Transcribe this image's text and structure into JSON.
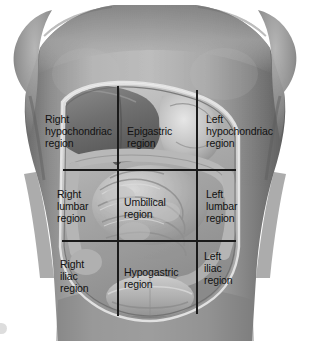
{
  "figure": {
    "style": "grayscale-anatomical-illustration",
    "background_color": "#ffffff",
    "line_color": "#1a1a1a",
    "label_color": "#111111"
  },
  "palette": {
    "skin_light": "#b9b9b9",
    "skin_mid": "#9a9a9a",
    "skin_dark": "#6e6e6e",
    "skin_shadow": "#555555",
    "cavity_rim": "#d8d8d8",
    "viscera_light": "#c9c9c9",
    "viscera_mid": "#a6a6a6",
    "viscera_dark": "#7d7d7d",
    "grid_line": "#1a1a1a"
  },
  "grid": {
    "vertical_lines_x": [
      118,
      197
    ],
    "horizontal_lines_y": [
      170,
      241
    ],
    "rows": 3,
    "columns": 3
  },
  "regions": [
    {
      "id": "right-hypochondriac",
      "label": "Right\nhypochondriac\nregion",
      "row": 1,
      "column": 1,
      "label_x": 45,
      "label_y": 113
    },
    {
      "id": "epigastric",
      "label": "Epigastric\nregion",
      "row": 1,
      "column": 2,
      "label_x": 127,
      "label_y": 125
    },
    {
      "id": "left-hypochondriac",
      "label": "Left\nhypochondriac\nregion",
      "row": 1,
      "column": 3,
      "label_x": 206,
      "label_y": 113
    },
    {
      "id": "right-lumbar",
      "label": "Right\nlumbar\nregion",
      "row": 2,
      "column": 1,
      "label_x": 57,
      "label_y": 188
    },
    {
      "id": "umbilical",
      "label": "Umbilical\nregion",
      "row": 2,
      "column": 2,
      "label_x": 124,
      "label_y": 196
    },
    {
      "id": "left-lumbar",
      "label": "Left\nlumbar\nregion",
      "row": 2,
      "column": 3,
      "label_x": 206,
      "label_y": 188
    },
    {
      "id": "right-iliac",
      "label": "Right\niliac\nregion",
      "row": 3,
      "column": 1,
      "label_x": 60,
      "label_y": 258
    },
    {
      "id": "hypogastric",
      "label": "Hypogastric\nregion",
      "row": 3,
      "column": 2,
      "label_x": 124,
      "label_y": 266
    },
    {
      "id": "left-iliac",
      "label": "Left\niliac\nregion",
      "row": 3,
      "column": 3,
      "label_x": 204,
      "label_y": 250
    }
  ]
}
